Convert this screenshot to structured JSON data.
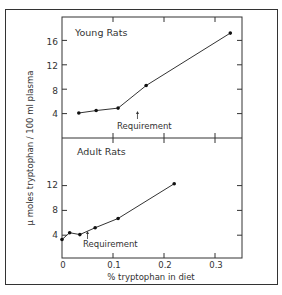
{
  "chart_data": [
    {
      "type": "line",
      "panel": "upper",
      "title": "Young Rats",
      "annotation": {
        "text": "Requirement",
        "x": 0.148
      },
      "x": [
        0.033,
        0.067,
        0.11,
        0.165,
        0.33
      ],
      "values": [
        4.1,
        4.5,
        4.9,
        8.6,
        17.2
      ],
      "yticks": [
        4,
        8,
        12,
        16
      ],
      "ylim": [
        0,
        20
      ],
      "xlim": [
        0,
        0.35
      ]
    },
    {
      "type": "line",
      "panel": "lower",
      "title": "Adult Rats",
      "annotation": {
        "text": "Requirement",
        "x": 0.05
      },
      "x": [
        0,
        0.015,
        0.035,
        0.065,
        0.11,
        0.22
      ],
      "values": [
        3.3,
        4.4,
        4.1,
        5.2,
        6.7,
        12.3
      ],
      "yticks": [
        4,
        8,
        12
      ],
      "ylim": [
        0,
        19
      ],
      "xlim": [
        0,
        0.35
      ]
    }
  ],
  "axes": {
    "xlabel": "% tryptophan in diet",
    "ylabel": "μ moles tryptophan / 100 ml plasma",
    "xticks": [
      "0",
      "0.1",
      "0.2",
      "0.3"
    ],
    "xtick_values": [
      0,
      0.1,
      0.2,
      0.3
    ]
  },
  "labels": {
    "upper_title": "Young Rats",
    "lower_title": "Adult Rats",
    "upper_req": "Requirement",
    "lower_req": "Requirement",
    "y16": "16",
    "y12u": "12",
    "y8u": "8",
    "y4u": "4",
    "y12l": "12",
    "y8l": "8",
    "y4l": "4",
    "x0": "0",
    "x1": "0.1",
    "x2": "0.2",
    "x3": "0.3"
  }
}
